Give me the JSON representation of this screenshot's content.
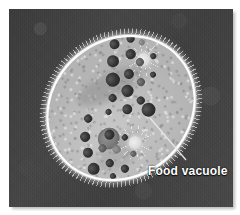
{
  "figure": {
    "kind": "light-micrograph",
    "background_color": "#404040",
    "photo_border_color": "#ffffff"
  },
  "annotations": [
    {
      "id": "food-vacuole",
      "label": "Food vacuole",
      "text_color": "#ffffff",
      "leader_color": "#e8e8e8",
      "leader_from": {
        "x": 150,
        "y": 118
      },
      "leader_to": {
        "x": 186,
        "y": 160
      }
    }
  ],
  "cell": {
    "name": "paramecium-cell",
    "outline_color": "#ffffff",
    "cytoplasm_color": "#bdbdbd",
    "rotation_deg": -40,
    "organelles": {
      "macronucleus": {
        "label": "macronucleus",
        "color": "#7a7a7a"
      },
      "contractile_vacuoles": [
        {
          "label": "contractile-vacuole-anterior",
          "color": "#dcdcdc"
        },
        {
          "label": "contractile-vacuole-posterior",
          "color": "#dcdcdc"
        }
      ],
      "food_vacuole_color": "#2e2e2e",
      "cilia_color": "#ebebeb"
    }
  },
  "food_vacuoles": [
    {
      "x": 112,
      "y": 14,
      "r": 5.0,
      "tone": "dark"
    },
    {
      "x": 128,
      "y": 20,
      "r": 4.2,
      "tone": "dark"
    },
    {
      "x": 140,
      "y": 12,
      "r": 3.2,
      "tone": "mid"
    },
    {
      "x": 100,
      "y": 26,
      "r": 6.0,
      "tone": "dark"
    },
    {
      "x": 118,
      "y": 32,
      "r": 4.6,
      "tone": "dark"
    },
    {
      "x": 134,
      "y": 30,
      "r": 3.4,
      "tone": "pale"
    },
    {
      "x": 146,
      "y": 26,
      "r": 2.6,
      "tone": "dark"
    },
    {
      "x": 88,
      "y": 40,
      "r": 6.6,
      "tone": "dark"
    },
    {
      "x": 104,
      "y": 46,
      "r": 5.2,
      "tone": "dark"
    },
    {
      "x": 120,
      "y": 44,
      "r": 4.0,
      "tone": "mid"
    },
    {
      "x": 134,
      "y": 48,
      "r": 3.0,
      "tone": "dark"
    },
    {
      "x": 76,
      "y": 54,
      "r": 4.4,
      "tone": "dark"
    },
    {
      "x": 92,
      "y": 58,
      "r": 5.6,
      "tone": "dark"
    },
    {
      "x": 108,
      "y": 60,
      "r": 4.2,
      "tone": "mid"
    },
    {
      "x": 122,
      "y": 62,
      "r": 3.2,
      "tone": "dark"
    },
    {
      "x": 80,
      "y": 72,
      "r": 5.0,
      "tone": "dark"
    },
    {
      "x": 96,
      "y": 74,
      "r": 3.8,
      "tone": "dark"
    },
    {
      "x": 64,
      "y": 62,
      "r": 3.0,
      "tone": "dark"
    },
    {
      "x": 44,
      "y": 54,
      "r": 3.6,
      "tone": "dark"
    },
    {
      "x": 30,
      "y": 66,
      "r": 4.6,
      "tone": "dark"
    },
    {
      "x": 22,
      "y": 80,
      "r": 5.4,
      "tone": "dark"
    },
    {
      "x": 36,
      "y": 86,
      "r": 4.0,
      "tone": "mid"
    },
    {
      "x": 50,
      "y": 80,
      "r": 4.8,
      "tone": "dark"
    },
    {
      "x": 16,
      "y": 96,
      "r": 6.0,
      "tone": "dark"
    },
    {
      "x": 32,
      "y": 102,
      "r": 4.4,
      "tone": "dark"
    },
    {
      "x": 46,
      "y": 96,
      "r": 3.6,
      "tone": "pale"
    },
    {
      "x": 26,
      "y": 114,
      "r": 3.2,
      "tone": "dark"
    },
    {
      "x": 40,
      "y": 116,
      "r": 4.2,
      "tone": "dark"
    },
    {
      "x": 12,
      "y": 110,
      "r": 2.8,
      "tone": "dark"
    },
    {
      "x": 56,
      "y": 110,
      "r": 3.0,
      "tone": "mid"
    },
    {
      "x": 60,
      "y": 92,
      "r": 2.6,
      "tone": "dark"
    }
  ],
  "labelled_food_vacuole": {
    "x": 96,
    "y": 86,
    "r": 7.0
  }
}
